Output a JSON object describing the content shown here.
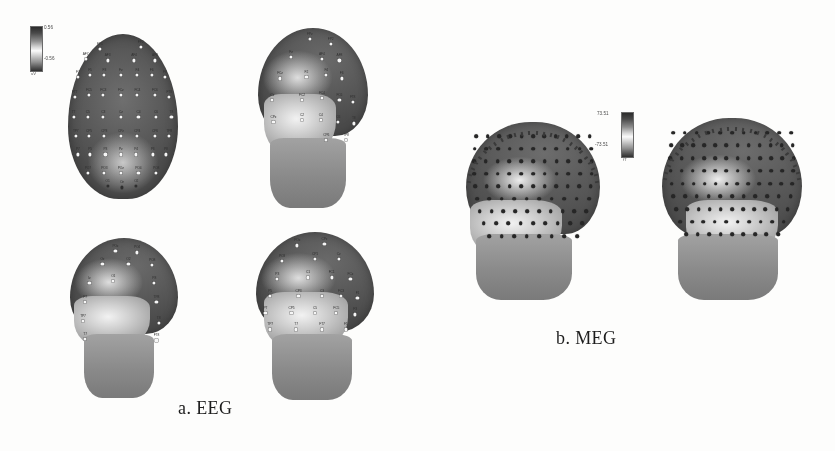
{
  "figure": {
    "panels": [
      {
        "id": "eeg",
        "caption": "a. EEG",
        "modality": "EEG",
        "views": [
          "top",
          "front-oblique",
          "back",
          "side-oblique"
        ],
        "sensor_count_visible": 64,
        "sensor_style": "labeled-white-discs"
      },
      {
        "id": "meg",
        "caption": "b. MEG",
        "modality": "MEG",
        "views": [
          "left-oblique",
          "right-oblique"
        ],
        "sensor_count_visible": 102,
        "sensor_style": "unlabeled-dark-dots"
      }
    ]
  },
  "colorbars": {
    "eeg": {
      "max": "0.56",
      "min": "-0.56",
      "unit": "uV",
      "name": "eeg-colorbar"
    },
    "meg": {
      "max": "73.51",
      "min": "-73.51",
      "unit": "fT",
      "name": "meg-colorbar"
    }
  },
  "eeg_labels": {
    "top_view": [
      {
        "t": "FP1",
        "x": 29,
        "y": 9
      },
      {
        "t": "FP2",
        "x": 66,
        "y": 8
      },
      {
        "t": "AF7",
        "x": 16,
        "y": 15
      },
      {
        "t": "AF8",
        "x": 79,
        "y": 16
      },
      {
        "t": "AF3",
        "x": 36,
        "y": 16
      },
      {
        "t": "AF4",
        "x": 60,
        "y": 16
      },
      {
        "t": "F7",
        "x": 9,
        "y": 26
      },
      {
        "t": "F8",
        "x": 88,
        "y": 26
      },
      {
        "t": "F5",
        "x": 20,
        "y": 25
      },
      {
        "t": "F3",
        "x": 33,
        "y": 25
      },
      {
        "t": "Fz",
        "x": 48,
        "y": 25
      },
      {
        "t": "F4",
        "x": 63,
        "y": 25
      },
      {
        "t": "F6",
        "x": 76,
        "y": 25
      },
      {
        "t": "FT7",
        "x": 6,
        "y": 38
      },
      {
        "t": "FT8",
        "x": 92,
        "y": 38
      },
      {
        "t": "FC5",
        "x": 19,
        "y": 37
      },
      {
        "t": "FC3",
        "x": 32,
        "y": 37
      },
      {
        "t": "FCz",
        "x": 48,
        "y": 37
      },
      {
        "t": "FC4",
        "x": 63,
        "y": 37
      },
      {
        "t": "FC6",
        "x": 79,
        "y": 37
      },
      {
        "t": "T7",
        "x": 5,
        "y": 50
      },
      {
        "t": "T8",
        "x": 94,
        "y": 50
      },
      {
        "t": "C5",
        "x": 18,
        "y": 50
      },
      {
        "t": "C3",
        "x": 32,
        "y": 50
      },
      {
        "t": "Cz",
        "x": 48,
        "y": 50
      },
      {
        "t": "C4",
        "x": 64,
        "y": 50
      },
      {
        "t": "C6",
        "x": 80,
        "y": 50
      },
      {
        "t": "TP7",
        "x": 7,
        "y": 62
      },
      {
        "t": "TP8",
        "x": 92,
        "y": 62
      },
      {
        "t": "CP5",
        "x": 19,
        "y": 62
      },
      {
        "t": "CP3",
        "x": 33,
        "y": 62
      },
      {
        "t": "CPz",
        "x": 48,
        "y": 62
      },
      {
        "t": "CP4",
        "x": 63,
        "y": 62
      },
      {
        "t": "CP6",
        "x": 79,
        "y": 62
      },
      {
        "t": "P7",
        "x": 9,
        "y": 73
      },
      {
        "t": "P8",
        "x": 89,
        "y": 73
      },
      {
        "t": "P5",
        "x": 20,
        "y": 73
      },
      {
        "t": "P3",
        "x": 34,
        "y": 73
      },
      {
        "t": "Pz",
        "x": 48,
        "y": 73
      },
      {
        "t": "P4",
        "x": 62,
        "y": 73
      },
      {
        "t": "P6",
        "x": 77,
        "y": 73
      },
      {
        "t": "PO7",
        "x": 18,
        "y": 84
      },
      {
        "t": "PO8",
        "x": 80,
        "y": 84
      },
      {
        "t": "PO3",
        "x": 33,
        "y": 84
      },
      {
        "t": "POz",
        "x": 48,
        "y": 84
      },
      {
        "t": "PO4",
        "x": 64,
        "y": 84
      },
      {
        "t": "O1",
        "x": 36,
        "y": 92
      },
      {
        "t": "Oz",
        "x": 49,
        "y": 93
      },
      {
        "t": "O2",
        "x": 62,
        "y": 92
      }
    ],
    "front_oblique_view": [
      {
        "t": "FPz",
        "x": 47,
        "y": 6
      },
      {
        "t": "FP2",
        "x": 66,
        "y": 9
      },
      {
        "t": "Fz",
        "x": 30,
        "y": 16
      },
      {
        "t": "AF4",
        "x": 58,
        "y": 17
      },
      {
        "t": "AF8",
        "x": 74,
        "y": 18
      },
      {
        "t": "FCz",
        "x": 20,
        "y": 28
      },
      {
        "t": "F2",
        "x": 44,
        "y": 27
      },
      {
        "t": "F4",
        "x": 62,
        "y": 26
      },
      {
        "t": "F6",
        "x": 76,
        "y": 28
      },
      {
        "t": "Cz",
        "x": 13,
        "y": 40
      },
      {
        "t": "FC2",
        "x": 40,
        "y": 40
      },
      {
        "t": "FC4",
        "x": 58,
        "y": 39
      },
      {
        "t": "FC6",
        "x": 74,
        "y": 40
      },
      {
        "t": "FT8",
        "x": 86,
        "y": 41
      },
      {
        "t": "CPz",
        "x": 14,
        "y": 52
      },
      {
        "t": "C2",
        "x": 40,
        "y": 51
      },
      {
        "t": "C4",
        "x": 57,
        "y": 51
      },
      {
        "t": "C6",
        "x": 73,
        "y": 52
      },
      {
        "t": "T8",
        "x": 87,
        "y": 53
      },
      {
        "t": "TP8",
        "x": 80,
        "y": 62
      },
      {
        "t": "CP6",
        "x": 62,
        "y": 62
      }
    ],
    "back_view": [
      {
        "t": "POz",
        "x": 42,
        "y": 8
      },
      {
        "t": "PO4",
        "x": 62,
        "y": 9
      },
      {
        "t": "Oz",
        "x": 30,
        "y": 16
      },
      {
        "t": "O2",
        "x": 54,
        "y": 16
      },
      {
        "t": "PO8",
        "x": 76,
        "y": 17
      },
      {
        "t": "Iz",
        "x": 18,
        "y": 28
      },
      {
        "t": "O1",
        "x": 40,
        "y": 27
      },
      {
        "t": "P8",
        "x": 78,
        "y": 28
      },
      {
        "t": "P7",
        "x": 14,
        "y": 40
      },
      {
        "t": "TP8",
        "x": 80,
        "y": 40
      },
      {
        "t": "TP7",
        "x": 12,
        "y": 52
      },
      {
        "t": "T8",
        "x": 82,
        "y": 53
      },
      {
        "t": "T7",
        "x": 14,
        "y": 63
      },
      {
        "t": "FT8",
        "x": 80,
        "y": 64
      }
    ],
    "side_oblique_view": [
      {
        "t": "POz",
        "x": 35,
        "y": 8
      },
      {
        "t": "CPz",
        "x": 58,
        "y": 7
      },
      {
        "t": "PO3",
        "x": 22,
        "y": 17
      },
      {
        "t": "CP1",
        "x": 50,
        "y": 16
      },
      {
        "t": "Cz",
        "x": 70,
        "y": 16
      },
      {
        "t": "P3",
        "x": 18,
        "y": 28
      },
      {
        "t": "C1",
        "x": 44,
        "y": 27
      },
      {
        "t": "FC1",
        "x": 64,
        "y": 27
      },
      {
        "t": "FCz",
        "x": 80,
        "y": 28
      },
      {
        "t": "P5",
        "x": 12,
        "y": 38
      },
      {
        "t": "CP3",
        "x": 36,
        "y": 38
      },
      {
        "t": "C3",
        "x": 56,
        "y": 38
      },
      {
        "t": "FC3",
        "x": 72,
        "y": 38
      },
      {
        "t": "F1",
        "x": 86,
        "y": 39
      },
      {
        "t": "P7",
        "x": 8,
        "y": 48
      },
      {
        "t": "CP5",
        "x": 30,
        "y": 48
      },
      {
        "t": "C5",
        "x": 50,
        "y": 48
      },
      {
        "t": "FC5",
        "x": 68,
        "y": 48
      },
      {
        "t": "F3",
        "x": 84,
        "y": 49
      },
      {
        "t": "TP7",
        "x": 12,
        "y": 58
      },
      {
        "t": "T7",
        "x": 34,
        "y": 58
      },
      {
        "t": "FT7",
        "x": 56,
        "y": 58
      },
      {
        "t": "F5",
        "x": 76,
        "y": 58
      }
    ]
  }
}
